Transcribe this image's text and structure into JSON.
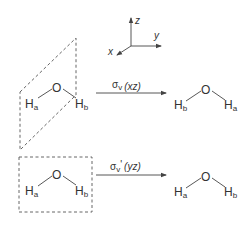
{
  "axes": {
    "z_label": "z",
    "y_label": "y",
    "x_label": "x"
  },
  "top_row": {
    "plane_shape": "parallelogram (xz plane)",
    "left_molecule": {
      "center": "O",
      "left_h": "H",
      "left_sub": "a",
      "right_h": "H",
      "right_sub": "b"
    },
    "operation": {
      "symbol": "σ",
      "sub": "v",
      "prime": "",
      "plane": "(xz)"
    },
    "right_molecule": {
      "center": "O",
      "left_h": "H",
      "left_sub": "b",
      "right_h": "H",
      "right_sub": "a"
    }
  },
  "bottom_row": {
    "plane_shape": "rectangle (yz plane)",
    "left_molecule": {
      "center": "O",
      "left_h": "H",
      "left_sub": "a",
      "right_h": "H",
      "right_sub": "b"
    },
    "operation": {
      "symbol": "σ",
      "sub": "v",
      "prime": "'",
      "plane": "(yz)"
    },
    "right_molecule": {
      "center": "O",
      "left_h": "H",
      "left_sub": "a",
      "right_h": "H",
      "right_sub": "b"
    }
  },
  "colors": {
    "line": "#444444",
    "text": "#333333",
    "background": "#ffffff"
  }
}
